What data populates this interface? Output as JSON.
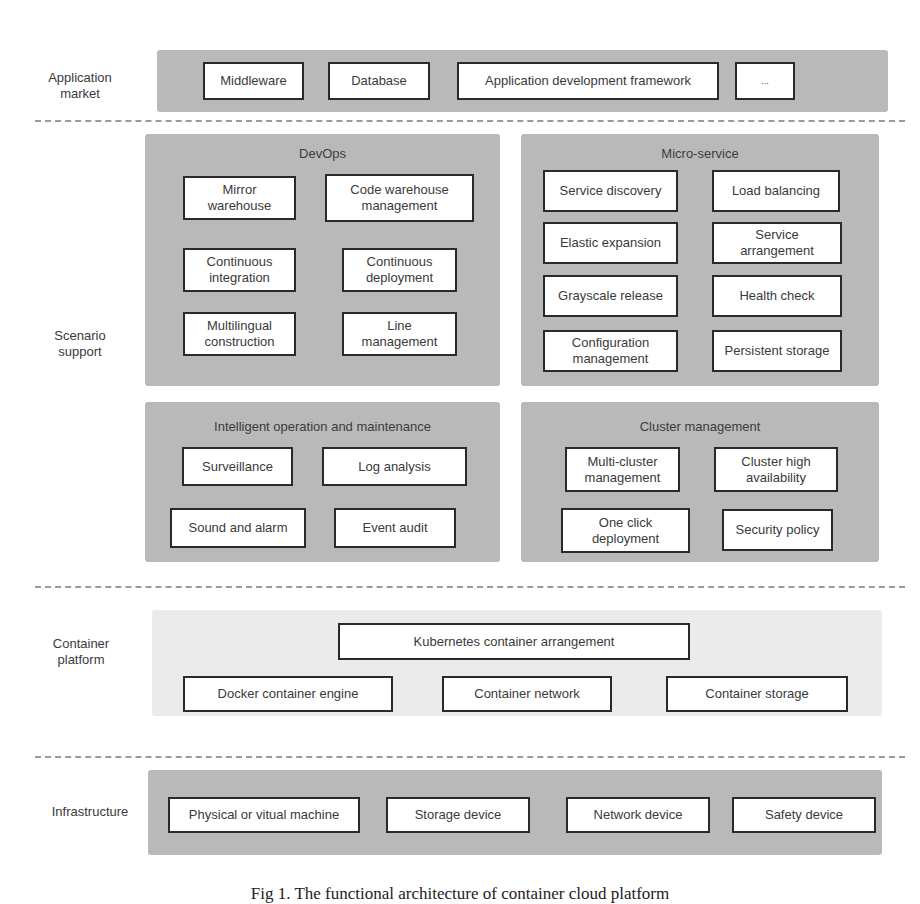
{
  "layers": {
    "application_market": {
      "label": "Application\nmarket",
      "items": [
        "Middleware",
        "Database",
        "Application development framework",
        "..."
      ]
    },
    "scenario_support": {
      "label": "Scenario\nsupport",
      "groups": {
        "devops": {
          "title": "DevOps",
          "items": [
            "Mirror warehouse",
            "Code warehouse management",
            "Continuous integration",
            "Continuous deployment",
            "Multilingual construction",
            "Line management"
          ]
        },
        "micro_service": {
          "title": "Micro-service",
          "items": [
            "Service discovery",
            "Load balancing",
            "Elastic expansion",
            "Service arrangement",
            "Grayscale release",
            "Health check",
            "Configuration management",
            "Persistent storage"
          ]
        },
        "ops": {
          "title": "Intelligent operation and maintenance",
          "items": [
            "Surveillance",
            "Log analysis",
            "Sound and alarm",
            "Event audit"
          ]
        },
        "cluster": {
          "title": "Cluster management",
          "items": [
            "Multi-cluster management",
            "Cluster high availability",
            "One click deployment",
            "Security policy"
          ]
        }
      }
    },
    "container_platform": {
      "label": "Container\nplatform",
      "items": [
        "Kubernetes container arrangement",
        "Docker container engine",
        "Container network",
        "Container storage"
      ]
    },
    "infrastructure": {
      "label": "Infrastructure",
      "items": [
        "Physical or vitual machine",
        "Storage device",
        "Network device",
        "Safety device"
      ]
    }
  },
  "caption": "Fig 1. The functional architecture of container cloud platform"
}
